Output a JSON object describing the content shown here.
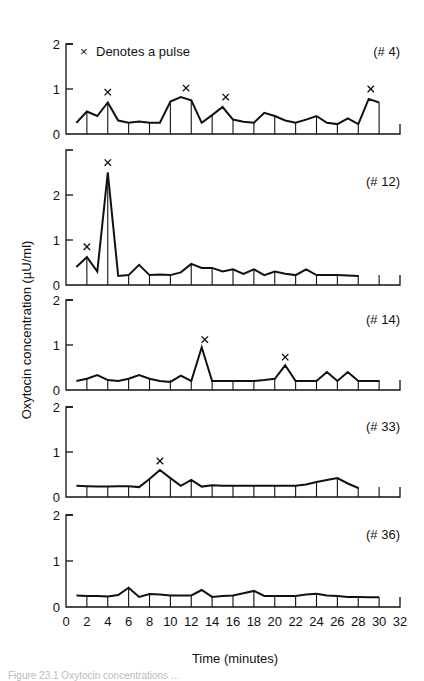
{
  "chart_data": {
    "type": "line",
    "title": "",
    "legend": {
      "marker": "×",
      "label": "Denotes a pulse",
      "position": "top-left of first panel"
    },
    "xlabel": "Time (minutes)",
    "ylabel": "Oxytocin concentration (µU/ml)",
    "xlim": [
      0,
      32
    ],
    "xticks": [
      0,
      2,
      4,
      6,
      8,
      10,
      12,
      14,
      16,
      18,
      20,
      22,
      24,
      26,
      28,
      30,
      32
    ],
    "grid": false,
    "panels": [
      {
        "id": "(# 4)",
        "ylim": [
          0,
          2
        ],
        "yticks": [
          0,
          1,
          2
        ],
        "x": [
          1,
          2,
          3,
          4,
          5,
          6,
          7,
          8,
          9,
          10,
          11,
          12,
          13,
          14,
          15,
          16,
          17,
          18,
          19,
          20,
          21,
          22,
          23,
          24,
          25,
          26,
          27,
          28,
          29,
          30
        ],
        "values": [
          0.25,
          0.5,
          0.4,
          0.7,
          0.3,
          0.25,
          0.28,
          0.25,
          0.25,
          0.72,
          0.82,
          0.75,
          0.25,
          0.42,
          0.6,
          0.32,
          0.27,
          0.25,
          0.47,
          0.4,
          0.3,
          0.25,
          0.32,
          0.4,
          0.25,
          0.22,
          0.35,
          0.22,
          0.78,
          0.7
        ],
        "pulses": [
          {
            "x": 4,
            "y": 0.93
          },
          {
            "x": 11.5,
            "y": 1.02
          },
          {
            "x": 15.3,
            "y": 0.82
          },
          {
            "x": 29.2,
            "y": 1.0
          }
        ]
      },
      {
        "id": "(# 12)",
        "ylim": [
          0,
          3
        ],
        "yticks": [
          0,
          1,
          2
        ],
        "x": [
          1,
          2,
          3,
          4,
          5,
          6,
          7,
          8,
          9,
          10,
          11,
          12,
          13,
          14,
          15,
          16,
          17,
          18,
          19,
          20,
          21,
          22,
          23,
          24,
          25,
          26,
          27,
          28
        ],
        "values": [
          0.4,
          0.62,
          0.3,
          2.5,
          0.2,
          0.22,
          0.45,
          0.22,
          0.23,
          0.22,
          0.28,
          0.47,
          0.38,
          0.38,
          0.3,
          0.35,
          0.25,
          0.35,
          0.22,
          0.3,
          0.25,
          0.22,
          0.35,
          0.22,
          0.22,
          0.22,
          0.21,
          0.2
        ],
        "pulses": [
          {
            "x": 2,
            "y": 0.85
          },
          {
            "x": 4,
            "y": 2.72
          }
        ]
      },
      {
        "id": "(# 14)",
        "ylim": [
          0,
          2
        ],
        "yticks": [
          0,
          1,
          2
        ],
        "x": [
          1,
          2,
          3,
          4,
          5,
          6,
          7,
          8,
          9,
          10,
          11,
          12,
          13,
          14,
          15,
          16,
          17,
          18,
          19,
          20,
          21,
          22,
          23,
          24,
          25,
          26,
          27,
          28,
          29,
          30
        ],
        "values": [
          0.2,
          0.25,
          0.33,
          0.22,
          0.2,
          0.25,
          0.33,
          0.25,
          0.2,
          0.18,
          0.32,
          0.2,
          0.95,
          0.2,
          0.2,
          0.2,
          0.2,
          0.2,
          0.22,
          0.25,
          0.55,
          0.2,
          0.2,
          0.2,
          0.4,
          0.2,
          0.4,
          0.2,
          0.2,
          0.2
        ],
        "pulses": [
          {
            "x": 13.3,
            "y": 1.12
          },
          {
            "x": 21,
            "y": 0.73
          }
        ]
      },
      {
        "id": "(# 33)",
        "ylim": [
          0,
          2
        ],
        "yticks": [
          0,
          1,
          2
        ],
        "x": [
          1,
          2,
          3,
          4,
          5,
          6,
          7,
          8,
          9,
          10,
          11,
          12,
          13,
          14,
          15,
          16,
          17,
          18,
          19,
          20,
          21,
          22,
          23,
          24,
          25,
          26,
          27,
          28
        ],
        "values": [
          0.25,
          0.24,
          0.23,
          0.23,
          0.24,
          0.24,
          0.22,
          0.4,
          0.6,
          0.42,
          0.25,
          0.38,
          0.23,
          0.26,
          0.25,
          0.25,
          0.25,
          0.25,
          0.25,
          0.25,
          0.25,
          0.25,
          0.28,
          0.33,
          0.38,
          0.42,
          0.3,
          0.2
        ],
        "pulses": [
          {
            "x": 9,
            "y": 0.8
          }
        ]
      },
      {
        "id": "(# 36)",
        "ylim": [
          0,
          2
        ],
        "yticks": [
          0,
          1,
          2
        ],
        "x": [
          1,
          2,
          3,
          4,
          5,
          6,
          7,
          8,
          9,
          10,
          11,
          12,
          13,
          14,
          15,
          16,
          17,
          18,
          19,
          20,
          21,
          22,
          23,
          24,
          25,
          26,
          27,
          28,
          29,
          30
        ],
        "values": [
          0.25,
          0.24,
          0.24,
          0.23,
          0.26,
          0.42,
          0.22,
          0.28,
          0.27,
          0.25,
          0.25,
          0.25,
          0.37,
          0.22,
          0.24,
          0.25,
          0.3,
          0.35,
          0.24,
          0.24,
          0.24,
          0.24,
          0.27,
          0.29,
          0.25,
          0.24,
          0.22,
          0.22,
          0.21,
          0.21
        ],
        "pulses": []
      }
    ]
  },
  "caption": "Figure 23.1 Oxytocin concentrations ..."
}
